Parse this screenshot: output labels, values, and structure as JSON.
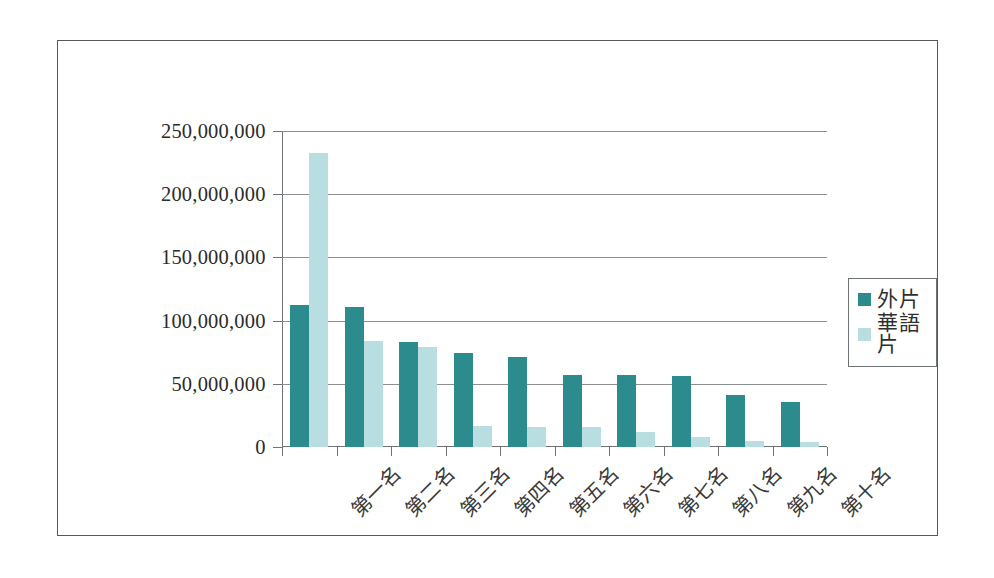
{
  "chart_data": {
    "type": "bar",
    "title": "",
    "xlabel": "",
    "ylabel": "",
    "ylim": [
      0,
      250000000
    ],
    "grid": true,
    "legend_position": "right",
    "categories": [
      "第一名",
      "第二名",
      "第三名",
      "第四名",
      "第五名",
      "第六名",
      "第七名",
      "第八名",
      "第九名",
      "第十名"
    ],
    "ytick_labels": [
      "250,000,000",
      "200,000,000",
      "150,000,000",
      "100,000,000",
      "50,000,000",
      "0"
    ],
    "ytick_values": [
      250000000,
      200000000,
      150000000,
      100000000,
      50000000,
      0
    ],
    "series": [
      {
        "name": "外片",
        "color": "#2b8b8d",
        "values": [
          112000000,
          111000000,
          83000000,
          74000000,
          71000000,
          57000000,
          57000000,
          56000000,
          41000000,
          36000000
        ]
      },
      {
        "name": "華語片",
        "color": "#b9dee1",
        "values": [
          233000000,
          84000000,
          79000000,
          17000000,
          16000000,
          16000000,
          12000000,
          8000000,
          5000000,
          4000000
        ]
      }
    ]
  },
  "colors": {
    "series_dark": "#2b8b8d",
    "series_light": "#b9dee1",
    "frame": "#555a5c",
    "axis": "#6e7375",
    "gridline": "#8b8f91"
  }
}
